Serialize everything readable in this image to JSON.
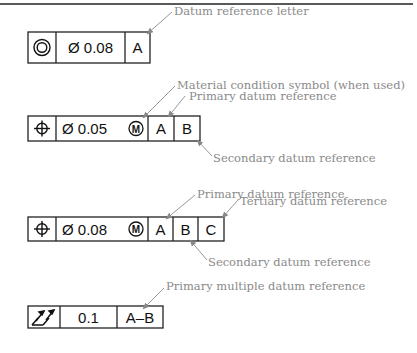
{
  "figure": {
    "top_rule": true,
    "frames": [
      {
        "id": "frame-concentricity",
        "symbol": "concentricity-icon",
        "tolerance": "Ø 0.08",
        "modifier": "",
        "datums": [
          "A"
        ]
      },
      {
        "id": "frame-position-ab",
        "symbol": "position-icon",
        "tolerance": "Ø 0.05",
        "modifier": "M",
        "datums": [
          "A",
          "B"
        ]
      },
      {
        "id": "frame-position-abc",
        "symbol": "position-icon",
        "tolerance": "Ø 0.08",
        "modifier": "M",
        "datums": [
          "A",
          "B",
          "C"
        ]
      },
      {
        "id": "frame-runout",
        "symbol": "total-runout-icon",
        "tolerance": "0.1",
        "modifier": "",
        "datums": [
          "A–B"
        ]
      }
    ],
    "callouts": {
      "datum_reference_letter": "Datum reference letter",
      "material_condition": "Material condition symbol (when used)",
      "primary_1": "Primary datum reference",
      "secondary_1": "Secondary datum reference",
      "primary_2": "Primary datum reference",
      "tertiary_2": "Tertiary datum reference",
      "secondary_2": "Secondary datum reference",
      "primary_multiple": "Primary multiple datum reference"
    }
  }
}
